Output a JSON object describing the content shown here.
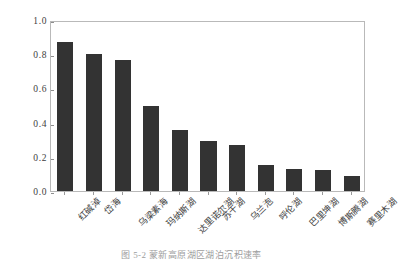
{
  "chart_data": {
    "type": "bar",
    "title": "",
    "xlabel": "",
    "ylabel": "沉积速率/ (cm/a)",
    "ylim": [
      0.0,
      1.0
    ],
    "yticks": [
      "0.0",
      "0.2",
      "0.4",
      "0.6",
      "0.8",
      "1.0"
    ],
    "ytick_values": [
      0.0,
      0.2,
      0.4,
      0.6,
      0.8,
      1.0
    ],
    "grid": false,
    "legend": "none",
    "bar_color": "#333333",
    "frame_color": "#b9b9b9",
    "categories": [
      "红碱淖",
      "岱海",
      "乌梁素海",
      "玛纳斯湖",
      "达里诺尔湖",
      "苏干湖",
      "乌兰泡",
      "呼伦湖",
      "巴里坤湖",
      "博斯腾湖",
      "赛里木湖"
    ],
    "values": [
      0.87,
      0.8,
      0.765,
      0.5,
      0.355,
      0.29,
      0.27,
      0.15,
      0.13,
      0.12,
      0.09
    ]
  },
  "caption": {
    "text": "图 5-2  蒙新高原湖区湖泊沉积速率"
  }
}
